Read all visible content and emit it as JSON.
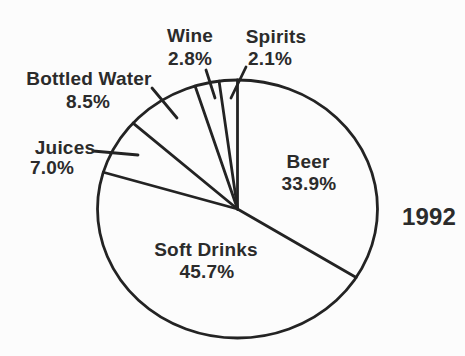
{
  "chart_data": {
    "type": "pie",
    "title": "",
    "categories": [
      "Beer",
      "Soft Drinks",
      "Juices",
      "Bottled Water",
      "Wine",
      "Spirits"
    ],
    "values": [
      33.9,
      45.7,
      7.0,
      8.5,
      2.8,
      2.1
    ],
    "value_labels": [
      "33.9%",
      "45.7%",
      "7.0%",
      "8.5%",
      "2.8%",
      "2.1%"
    ],
    "total": 100,
    "unit": "%",
    "start_angle_deg": 0,
    "direction": "clockwise",
    "annotation_year": "1992",
    "legend": "none",
    "label_placement": {
      "inside": [
        "Beer",
        "Soft Drinks"
      ],
      "outside_with_leader_line": [
        "Juices",
        "Bottled Water",
        "Wine",
        "Spirits"
      ]
    }
  },
  "colors": {
    "ink": "#232323",
    "text": "#2b2b2b",
    "background": "#fcfcfc"
  }
}
